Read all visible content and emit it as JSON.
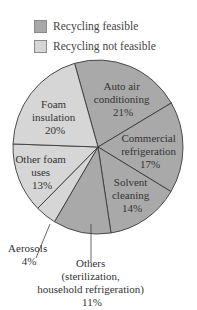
{
  "legend": {
    "items": [
      {
        "label": "Recycling feasible",
        "color": "#a9a9a9"
      },
      {
        "label": "Recycling not feasible",
        "color": "#d6d6d6"
      }
    ]
  },
  "chart_data": {
    "type": "pie",
    "title": "",
    "start_angle_deg": -16,
    "direction": "clockwise",
    "slices": [
      {
        "label": "Auto air conditioning",
        "value": 21,
        "category": "Recycling feasible"
      },
      {
        "label": "Commercial refrigeration",
        "value": 17,
        "category": "Recycling feasible"
      },
      {
        "label": "Solvent cleaning",
        "value": 14,
        "category": "Recycling feasible"
      },
      {
        "label": "Others (sterilization, household refrigeration)",
        "value": 11,
        "category": "Recycling feasible"
      },
      {
        "label": "Aerosols",
        "value": 4,
        "category": "Recycling not feasible"
      },
      {
        "label": "Other foam uses",
        "value": 13,
        "category": "Recycling not feasible"
      },
      {
        "label": "Foam insulation",
        "value": 20,
        "category": "Recycling not feasible"
      }
    ],
    "legend_entries": [
      "Recycling feasible",
      "Recycling not feasible"
    ],
    "legend_position": "top-left",
    "annotations": {
      "auto_air": [
        "Auto air",
        "conditioning",
        "21%"
      ],
      "commercial": [
        "Commercial",
        "refrigeration",
        "17%"
      ],
      "solvent": [
        "Solvent",
        "cleaning",
        "14%"
      ],
      "others": [
        "Others",
        "(sterilization,",
        "household refrigeration)",
        "11%"
      ],
      "aerosols": [
        "Aerosols",
        "4%"
      ],
      "other_foam": [
        "Other foam",
        "uses",
        "13%"
      ],
      "foam_insulation": [
        "Foam",
        "insulation",
        "20%"
      ]
    }
  }
}
